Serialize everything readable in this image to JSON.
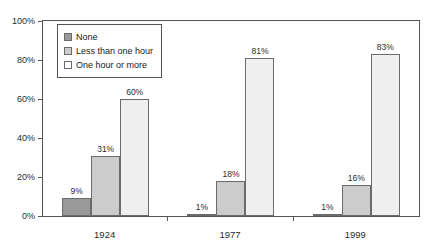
{
  "chart_data": {
    "type": "bar",
    "title": "",
    "xlabel": "",
    "ylabel": "",
    "ylim": [
      0,
      100
    ],
    "ytick_labels": [
      "0%",
      "20%",
      "40%",
      "60%",
      "80%",
      "100%"
    ],
    "ytick_values": [
      0,
      20,
      40,
      60,
      80,
      100
    ],
    "grid": false,
    "legend_position": "upper-left-inside",
    "categories": [
      "1924",
      "1977",
      "1999"
    ],
    "series": [
      {
        "name": "None",
        "color": "#999999",
        "values": [
          9,
          1,
          1
        ],
        "labels": [
          "9%",
          "1%",
          "1%"
        ]
      },
      {
        "name": "Less than one hour",
        "color": "#cccccc",
        "values": [
          31,
          18,
          16
        ],
        "labels": [
          "31%",
          "18%",
          "16%"
        ]
      },
      {
        "name": "One hour or more",
        "color": "#efefef",
        "values": [
          60,
          81,
          83
        ],
        "labels": [
          "60%",
          "81%",
          "83%"
        ]
      }
    ]
  },
  "legend": {
    "items": [
      {
        "label": "None"
      },
      {
        "label": "Less than one hour"
      },
      {
        "label": "One hour or more"
      }
    ]
  },
  "yaxis": {
    "ticks": [
      {
        "label": "100%"
      },
      {
        "label": "80%"
      },
      {
        "label": "60%"
      },
      {
        "label": "40%"
      },
      {
        "label": "20%"
      },
      {
        "label": "0%"
      }
    ]
  },
  "xaxis": {
    "ticks": [
      {
        "label": "1924"
      },
      {
        "label": "1977"
      },
      {
        "label": "1999"
      }
    ]
  }
}
